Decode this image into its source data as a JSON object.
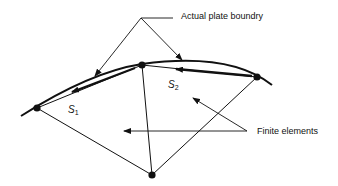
{
  "labels": {
    "boundary": "Actual plate boundry",
    "elements": "Finite elements",
    "s1_main": "S",
    "s1_sub": "1",
    "s2_main": "S",
    "s2_sub": "2"
  },
  "colors": {
    "ink": "#111111",
    "background": "#ffffff"
  }
}
